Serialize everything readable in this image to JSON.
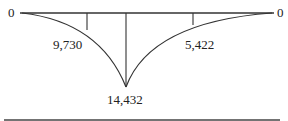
{
  "diagram": {
    "type": "bending-moment-diagram",
    "left_end_value": "0",
    "right_end_value": "0",
    "values": [
      {
        "label": "9,730",
        "position": "left-quarter"
      },
      {
        "label": "14,432",
        "position": "center-peak"
      },
      {
        "label": "5,422",
        "position": "right-quarter"
      }
    ],
    "line_color": "#333333"
  }
}
